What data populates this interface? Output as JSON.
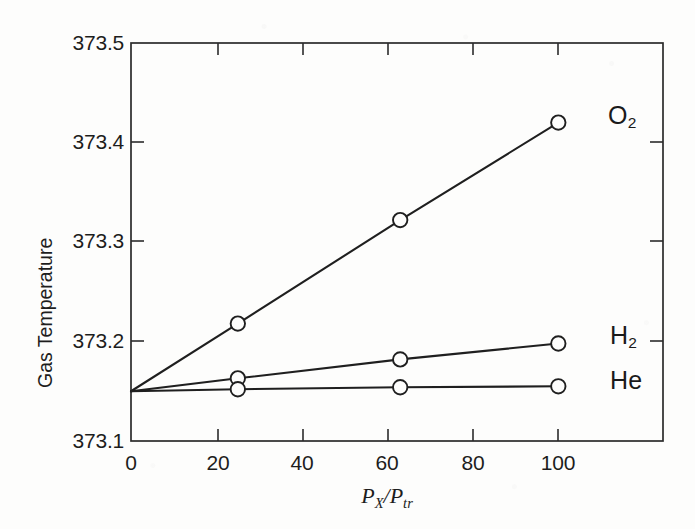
{
  "chart_data": {
    "type": "line",
    "title": "",
    "xlabel": "P_X / P_tr",
    "xlabel_parts": {
      "p1": "P",
      "sub1": "X",
      "slash": "/",
      "p2": "P",
      "sub2": "tr"
    },
    "ylabel": "Gas Temperature",
    "xlim": [
      0,
      124.5
    ],
    "ylim": [
      373.1,
      373.5
    ],
    "xticks": [
      0,
      20,
      40,
      60,
      80,
      100
    ],
    "xtick_labels": [
      "0",
      "20",
      "40",
      "60",
      "80",
      "100"
    ],
    "yticks": [
      373.1,
      373.2,
      373.3,
      373.4,
      373.5
    ],
    "ytick_labels": [
      "373.1",
      "373.2",
      "373.3",
      "373.4",
      "373.5"
    ],
    "grid": false,
    "legend_position": "inline-right-of-endpoint",
    "marker": "open-circle",
    "line_color": "#1f1f1f",
    "extrapolated_intercept": 373.15,
    "series": [
      {
        "name": "O2",
        "label_main": "O",
        "label_sub": "2",
        "x": [
          0,
          25,
          63,
          100
        ],
        "values": [
          373.15,
          373.218,
          373.322,
          373.42
        ],
        "markers_at": [
          25,
          63,
          100
        ]
      },
      {
        "name": "H2",
        "label_main": "H",
        "label_sub": "2",
        "x": [
          0,
          25,
          63,
          100
        ],
        "values": [
          373.15,
          373.163,
          373.182,
          373.198
        ],
        "markers_at": [
          25,
          63,
          100
        ]
      },
      {
        "name": "He",
        "label_main": "He",
        "label_sub": "",
        "x": [
          0,
          25,
          63,
          100
        ],
        "values": [
          373.15,
          373.152,
          373.154,
          373.155
        ],
        "markers_at": [
          25,
          63,
          100
        ]
      }
    ]
  }
}
